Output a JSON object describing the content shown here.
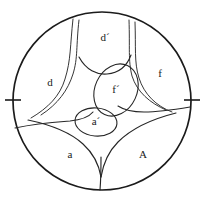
{
  "figure": {
    "background_color": "#ffffff",
    "ink_color": "#1b1b1b",
    "boundary": {
      "shape": "circle",
      "center_x": 102,
      "center_y": 101,
      "radius": 89,
      "stroke_width": 1.7
    },
    "ticks": [
      {
        "name": "left-tick",
        "x1": 5,
        "y1": 100,
        "x2": 21,
        "y2": 100
      },
      {
        "name": "right-tick",
        "x1": 184,
        "y1": 100,
        "x2": 200,
        "y2": 100
      }
    ],
    "labels": [
      {
        "id": "d-prime",
        "text": "d´",
        "x": 105,
        "y": 38
      },
      {
        "id": "d",
        "text": "d",
        "x": 50,
        "y": 83
      },
      {
        "id": "f",
        "text": "f",
        "x": 160,
        "y": 74
      },
      {
        "id": "f-prime",
        "text": "f´",
        "x": 116,
        "y": 90
      },
      {
        "id": "a-prime",
        "text": "a´",
        "x": 96,
        "y": 122
      },
      {
        "id": "a",
        "text": "a",
        "x": 70,
        "y": 155
      },
      {
        "id": "A",
        "text": "A",
        "x": 143,
        "y": 155
      }
    ],
    "ovals": [
      {
        "id": "f-prime-oval",
        "center_x": 116,
        "center_y": 90,
        "radius_x": 21,
        "radius_y": 27,
        "rotation": 25
      },
      {
        "id": "a-prime-oval",
        "center_x": 96,
        "center_y": 122,
        "radius_x": 21,
        "radius_y": 14,
        "rotation": 5
      }
    ],
    "curves": [
      {
        "id": "top-left-outer",
        "path": "M 73,19 C 70,46 71,60 65,79 C 60,96 48,108 31,118"
      },
      {
        "id": "top-left-inner",
        "path": "M 79,20 C 76,46 78,58 73,74 C 68,90 58,104 41,115"
      },
      {
        "id": "top-right-outer",
        "path": "M 135,22 C 136,48 134,62 139,78 C 144,94 156,106 172,112"
      },
      {
        "id": "top-right-inner",
        "path": "M 129,20 C 130,48 128,60 132,76 C 137,92 150,103 166,110"
      },
      {
        "id": "d-prime-floor",
        "path": "M 79,57 C 86,70 97,75 107,74 C 119,73 127,66 131,55"
      },
      {
        "id": "left-spur",
        "path": "M 15,128 C 38,123 56,122 70,121 C 80,120 88,118 93,112"
      },
      {
        "id": "right-spur",
        "path": "M 190,107 C 172,110 156,112 144,112 C 133,112 124,110 118,106"
      },
      {
        "id": "bottom-left-sweep",
        "path": "M 28,120 C 52,125 70,132 83,144 C 93,153 99,165 101,177"
      },
      {
        "id": "bottom-right-sweep",
        "path": "M 176,113 C 152,119 132,128 118,142 C 108,152 103,165 101,177"
      },
      {
        "id": "bottom-stem",
        "path": "M 101,157 C 101,168 101,178 100,190"
      }
    ]
  }
}
